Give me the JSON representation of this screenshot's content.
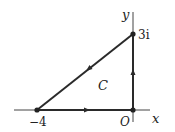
{
  "diagram": {
    "type": "contour-in-complex-plane",
    "axes": {
      "x_label": "x",
      "y_label": "y",
      "origin_label": "O"
    },
    "vertices": [
      {
        "label": "−4",
        "re": -4,
        "im": 0
      },
      {
        "label": "O",
        "re": 0,
        "im": 0
      },
      {
        "label": "3i",
        "re": 0,
        "im": 3
      }
    ],
    "contour_label": "C",
    "edges": [
      {
        "from": "−4",
        "to": "O",
        "direction": "right"
      },
      {
        "from": "O",
        "to": "3i",
        "direction": "up"
      },
      {
        "from": "3i",
        "to": "−4",
        "direction": "down-left"
      }
    ],
    "colors": {
      "line": "#2a2a2a",
      "axis": "#333333",
      "text": "#222222"
    }
  }
}
